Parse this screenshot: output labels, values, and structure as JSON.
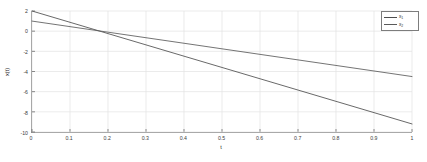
{
  "chart_data": {
    "type": "line",
    "title": "",
    "xlabel": "t",
    "ylabel": "x(t)",
    "xlim": [
      0,
      1
    ],
    "ylim": [
      -10,
      2
    ],
    "grid": true,
    "legend_position": "top-right",
    "x_ticks": [
      0,
      0.1,
      0.2,
      0.3,
      0.4,
      0.5,
      0.6,
      0.7,
      0.8,
      0.9,
      1
    ],
    "x_tick_labels": [
      "0",
      "0.1",
      "0.2",
      "0.3",
      "0.4",
      "0.5",
      "0.6",
      "0.7",
      "0.8",
      "0.9",
      "1"
    ],
    "y_ticks": [
      2,
      0,
      -2,
      -4,
      -6,
      -8,
      -10
    ],
    "y_tick_labels": [
      "2",
      "0",
      "-2",
      "-4",
      "-6",
      "-8",
      "-10"
    ],
    "series": [
      {
        "name": "x_1",
        "label_main": "x",
        "label_sub": "1",
        "color": "#4d4d4d",
        "x": [
          0,
          0.1,
          0.2,
          0.3,
          0.4,
          0.5,
          0.6,
          0.7,
          0.8,
          0.9,
          1
        ],
        "values": [
          2.0,
          0.88,
          -0.24,
          -1.36,
          -2.48,
          -3.6,
          -4.72,
          -5.84,
          -6.96,
          -8.08,
          -9.2
        ]
      },
      {
        "name": "x_2",
        "label_main": "x",
        "label_sub": "2",
        "color": "#5a5a5a",
        "x": [
          0,
          0.1,
          0.2,
          0.3,
          0.4,
          0.5,
          0.6,
          0.7,
          0.8,
          0.9,
          1
        ],
        "values": [
          1.0,
          0.45,
          -0.1,
          -0.65,
          -1.2,
          -1.75,
          -2.3,
          -2.85,
          -3.4,
          -3.95,
          -4.5
        ]
      }
    ]
  },
  "colors": {
    "background": "#ffffff",
    "grid": "#e2e2e2",
    "axis": "#8a8a8a",
    "tick_text": "#3c3c3c",
    "label_text": "#2e2e2e",
    "legend_border": "#7d7d7d"
  }
}
